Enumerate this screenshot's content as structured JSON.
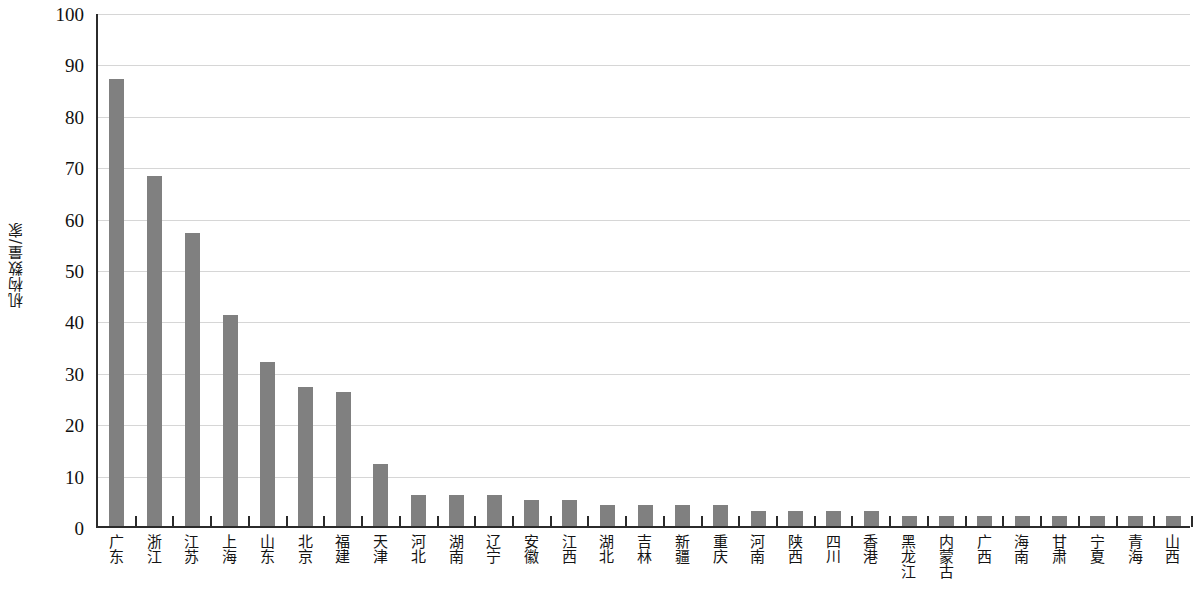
{
  "chart_data": {
    "type": "bar",
    "title": "",
    "xlabel": "",
    "ylabel": "机构数量/家",
    "ylim": [
      0,
      100
    ],
    "ytick_interval": 10,
    "grid": true,
    "legend": null,
    "bar_color": "#808080",
    "axis_color": "#2b2b2b",
    "gridline_color": "#d6d6d6",
    "background": "#ffffff",
    "ytick_labels": [
      "0",
      "10",
      "20",
      "30",
      "40",
      "50",
      "60",
      "70",
      "80",
      "90",
      "100"
    ],
    "categories": [
      "广东",
      "浙江",
      "江苏",
      "上海",
      "山东",
      "北京",
      "福建",
      "天津",
      "河北",
      "湖南",
      "辽宁",
      "安徽",
      "江西",
      "湖北",
      "吉林",
      "新疆",
      "重庆",
      "河南",
      "陕西",
      "四川",
      "香港",
      "黑龙江",
      "内蒙古",
      "广西",
      "海南",
      "甘肃",
      "宁夏",
      "青海",
      "山西"
    ],
    "values": [
      87,
      68,
      57,
      41,
      32,
      27,
      26,
      12,
      6,
      6,
      6,
      5,
      5,
      4,
      4,
      4,
      4,
      3,
      3,
      3,
      3,
      2,
      2,
      2,
      2,
      2,
      2,
      2,
      2
    ]
  }
}
